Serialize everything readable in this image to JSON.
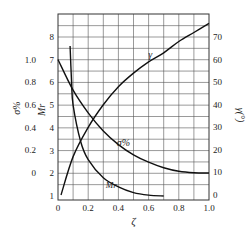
{
  "chart_data": {
    "type": "line",
    "title": "",
    "xlabel": "ζ",
    "xlim": [
      0,
      1.0
    ],
    "x_ticks": [
      "0",
      "0.2",
      "0.4",
      "0.6",
      "0.8",
      "1.0"
    ],
    "axes": {
      "left_outer": {
        "label": "σ%",
        "ticks": [
          "0",
          "0.2",
          "0.4",
          "0.6",
          "0.8",
          "1.0"
        ],
        "range": [
          0,
          1.0
        ]
      },
      "left_inner": {
        "label": "Mr",
        "ticks": [
          "1",
          "2",
          "3",
          "4",
          "5",
          "6",
          "7",
          "8"
        ],
        "range": [
          1,
          8
        ]
      },
      "right": {
        "label": "γ(°)",
        "ticks": [
          "0",
          "10",
          "20",
          "30",
          "40",
          "50",
          "60",
          "70"
        ],
        "range": [
          0,
          70
        ]
      }
    },
    "grid": true,
    "series": [
      {
        "name": "γ",
        "axis": "right",
        "x": [
          0.02,
          0.1,
          0.2,
          0.3,
          0.4,
          0.5,
          0.6,
          0.7,
          0.8,
          0.9,
          1.0
        ],
        "values": [
          0,
          17,
          30,
          40,
          48,
          54,
          59,
          63,
          68,
          72,
          76
        ]
      },
      {
        "name": "σ%",
        "axis": "left_outer",
        "x": [
          0,
          0.1,
          0.2,
          0.3,
          0.4,
          0.5,
          0.6,
          0.7,
          0.8,
          0.9,
          1.0
        ],
        "values": [
          1.0,
          0.73,
          0.53,
          0.37,
          0.25,
          0.16,
          0.095,
          0.046,
          0.015,
          0.002,
          0
        ]
      },
      {
        "name": "Mr",
        "axis": "left_inner",
        "x": [
          0.08,
          0.09,
          0.1,
          0.15,
          0.2,
          0.3,
          0.4,
          0.5,
          0.6,
          0.7
        ],
        "values": [
          7.6,
          6.0,
          5.0,
          3.4,
          2.6,
          1.8,
          1.4,
          1.15,
          1.04,
          1.0
        ]
      }
    ],
    "annotations": [
      "γ",
      "σ%",
      "Mr"
    ]
  }
}
